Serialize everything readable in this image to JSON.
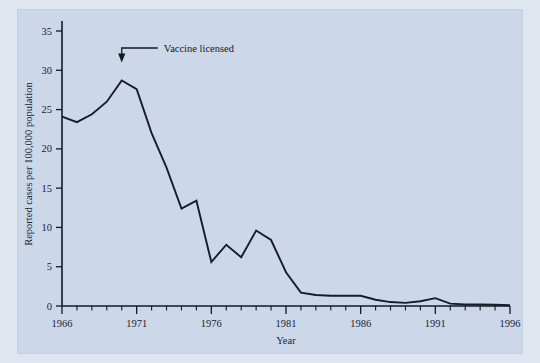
{
  "chart_data": {
    "type": "line",
    "title": "",
    "xlabel": "Year",
    "ylabel": "Reported cases per 100,000 population",
    "xlim": [
      1966,
      1996
    ],
    "ylim": [
      0,
      35
    ],
    "grid": false,
    "legend": "none",
    "x_ticks": [
      1966,
      1971,
      1976,
      1981,
      1986,
      1991,
      1996
    ],
    "x_tick_labels": [
      "1966",
      "1971",
      "1976",
      "1981",
      "1986",
      "1991",
      "1996"
    ],
    "x_minor_tick_step": 1,
    "y_ticks": [
      0,
      5,
      10,
      15,
      20,
      25,
      30,
      35
    ],
    "y_tick_labels": [
      "0",
      "5",
      "10",
      "15",
      "20",
      "25",
      "30",
      "35"
    ],
    "series": [
      {
        "name": "Reported cases",
        "color": "#151d28",
        "x": [
          1966,
          1967,
          1968,
          1969,
          1970,
          1971,
          1972,
          1973,
          1974,
          1975,
          1976,
          1977,
          1978,
          1979,
          1980,
          1981,
          1982,
          1983,
          1984,
          1985,
          1986,
          1987,
          1988,
          1989,
          1990,
          1991,
          1992,
          1993,
          1994,
          1995,
          1996
        ],
        "values": [
          24.1,
          23.4,
          24.4,
          26.0,
          28.7,
          27.6,
          22.0,
          17.6,
          12.4,
          13.4,
          5.6,
          7.8,
          6.2,
          9.6,
          8.4,
          4.3,
          1.7,
          1.4,
          1.3,
          1.3,
          1.3,
          0.8,
          0.5,
          0.4,
          0.6,
          1.0,
          0.3,
          0.2,
          0.2,
          0.15,
          0.1
        ]
      }
    ],
    "annotations": [
      {
        "text": "Vaccine licensed",
        "points_to_year": 1970,
        "points_to_value": 31.0
      }
    ]
  },
  "axis_labels": {
    "x_title": "Year",
    "y_title": "Reported cases per 100,000 population"
  },
  "annotation": {
    "label": "Vaccine licensed"
  }
}
